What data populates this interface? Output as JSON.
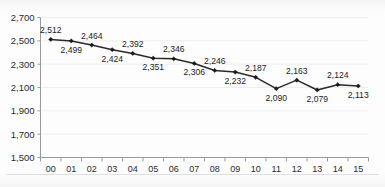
{
  "chart_data": {
    "type": "line",
    "title": "",
    "subtitle": "",
    "xlabel": "",
    "ylabel": "",
    "categories": [
      "00",
      "01",
      "02",
      "03",
      "04",
      "05",
      "06",
      "07",
      "08",
      "09",
      "10",
      "11",
      "12",
      "13",
      "14",
      "15"
    ],
    "values": [
      2512,
      2499,
      2464,
      2424,
      2392,
      2351,
      2346,
      2306,
      2246,
      2232,
      2187,
      2090,
      2163,
      2079,
      2124,
      2113
    ],
    "point_labels": [
      "2,512",
      "2,499",
      "2,464",
      "2,424",
      "2,392",
      "2,351",
      "2,346",
      "2,306",
      "2,246",
      "2,232",
      "2,187",
      "2,090",
      "2,163",
      "2,079",
      "2,124",
      "2,113"
    ],
    "label_positions": [
      "above",
      "below",
      "above",
      "below",
      "above",
      "below",
      "above",
      "below",
      "above",
      "below",
      "above",
      "below",
      "above",
      "below",
      "above",
      "below"
    ],
    "ylim": [
      1500,
      2700
    ],
    "ytick_values": [
      2700,
      2500,
      2300,
      2100,
      1900,
      1700,
      1500
    ],
    "ytick_labels": [
      "2,700",
      "2,500",
      "2,300",
      "2,100",
      "1,900",
      "1,700",
      "1,500"
    ],
    "grid": true,
    "legend": "none",
    "series_color": "#2a2a2a",
    "marker": "diamond",
    "annotations": []
  },
  "style": {
    "background": "#fdfdfd",
    "grid_color": "#eceef0",
    "axis_color": "#9a9a9a",
    "text_color": "#2b2b2b"
  }
}
